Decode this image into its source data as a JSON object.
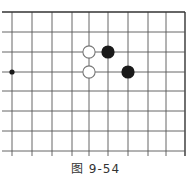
{
  "diagram": {
    "type": "go-board-fragment",
    "caption": "图 9-54",
    "grid": {
      "vertical_x": [
        12,
        32,
        52,
        72,
        89,
        108,
        128,
        148,
        166,
        185
      ],
      "horizontal_y": [
        12,
        32,
        52,
        72,
        91,
        111,
        131,
        151
      ],
      "top_border_y": 12,
      "right_border_x": 185,
      "extends_left": true,
      "extends_bottom": true,
      "line_color": "#555555",
      "border_color": "#333333"
    },
    "star_points": [
      {
        "col": 0,
        "row": 3
      }
    ],
    "stones": [
      {
        "color": "white",
        "col": 4,
        "row": 2
      },
      {
        "color": "white",
        "col": 4,
        "row": 3
      },
      {
        "color": "black",
        "col": 5,
        "row": 2
      },
      {
        "color": "black",
        "col": 6,
        "row": 3
      }
    ],
    "colors": {
      "black_stone": "#1a1a1a",
      "white_stone_fill": "#ffffff",
      "white_stone_stroke": "#777777",
      "background": "#ffffff"
    }
  }
}
